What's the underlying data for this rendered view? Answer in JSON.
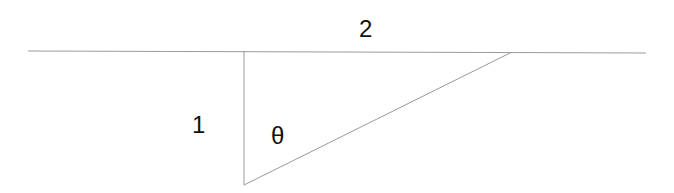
{
  "diagram": {
    "type": "right-triangle",
    "labels": {
      "top": "2",
      "left": "1",
      "angle": "θ"
    },
    "colors": {
      "line": "#9a9a9a",
      "text": "#111111",
      "background": "#ffffff"
    },
    "geometry": {
      "horizontal_line": {
        "x1": 28,
        "y1": 51,
        "x2": 646,
        "y2": 53
      },
      "vertical_leg": {
        "x1": 244,
        "y1": 51,
        "x2": 244,
        "y2": 185
      },
      "hypotenuse": {
        "x1": 244,
        "y1": 185,
        "x2": 510,
        "y2": 53
      }
    }
  }
}
